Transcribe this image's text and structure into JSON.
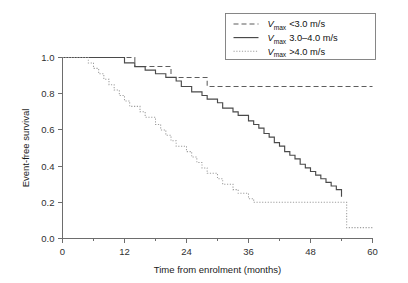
{
  "chart_data": {
    "type": "line",
    "title": "",
    "subtitle": "",
    "xlabel": "Time from enrolment (months)",
    "ylabel": "Event-free survival",
    "xlim": [
      0,
      60
    ],
    "ylim": [
      0.0,
      1.0
    ],
    "xticks": [
      0,
      12,
      24,
      36,
      48,
      60
    ],
    "xtick_labels": [
      "0",
      "12",
      "24",
      "36",
      "48",
      "60"
    ],
    "xminor_ticks": [
      6,
      18,
      30,
      42,
      54
    ],
    "yticks": [
      0.0,
      0.2,
      0.4,
      0.6,
      0.8,
      1.0
    ],
    "ytick_labels": [
      "0.0",
      "0.2",
      "0.4",
      "0.6",
      "0.8",
      "1.0"
    ],
    "grid": false,
    "legend_position": "top-right",
    "step_type": "post",
    "series": [
      {
        "name": "vmax_lt_3",
        "legend_prefix": "V",
        "legend_subscript": "max",
        "legend_value": "<3.0 m/s",
        "linestyle": "dashed",
        "color": "#5d5d5d",
        "x": [
          0,
          13,
          14,
          20,
          21,
          27,
          28,
          30,
          60
        ],
        "y": [
          1.0,
          1.0,
          0.95,
          0.95,
          0.89,
          0.89,
          0.84,
          0.84,
          0.84
        ]
      },
      {
        "name": "vmax_3_to_4",
        "legend_prefix": "V",
        "legend_subscript": "max",
        "legend_value": "3.0–4.0 m/s",
        "linestyle": "solid",
        "color": "#4a4a4a",
        "x": [
          0,
          10,
          12,
          14,
          16,
          18,
          20,
          22,
          23,
          25,
          27,
          28,
          30,
          31,
          33,
          34,
          36,
          37,
          38,
          39,
          40,
          41,
          42,
          43,
          44,
          45,
          46,
          47,
          48,
          49,
          50,
          51,
          52,
          53,
          54
        ],
        "y": [
          1.0,
          1.0,
          0.97,
          0.95,
          0.93,
          0.91,
          0.89,
          0.87,
          0.84,
          0.81,
          0.79,
          0.77,
          0.75,
          0.72,
          0.7,
          0.68,
          0.65,
          0.63,
          0.61,
          0.58,
          0.56,
          0.53,
          0.51,
          0.48,
          0.46,
          0.44,
          0.41,
          0.39,
          0.37,
          0.35,
          0.33,
          0.31,
          0.29,
          0.27,
          0.23
        ]
      },
      {
        "name": "vmax_gt_4",
        "legend_prefix": "V",
        "legend_subscript": "max",
        "legend_value": ">4.0 m/s",
        "linestyle": "dotted",
        "color": "#9e9e9e",
        "x": [
          0,
          4,
          5,
          6,
          7,
          8,
          9,
          10,
          11,
          12,
          13,
          15,
          16,
          18,
          19,
          20,
          21,
          22,
          24,
          25,
          26,
          27,
          28,
          30,
          31,
          33,
          34,
          36,
          37,
          54,
          55,
          60
        ],
        "y": [
          1.0,
          1.0,
          0.97,
          0.94,
          0.91,
          0.88,
          0.85,
          0.82,
          0.79,
          0.76,
          0.73,
          0.7,
          0.67,
          0.63,
          0.6,
          0.57,
          0.54,
          0.51,
          0.48,
          0.45,
          0.42,
          0.39,
          0.36,
          0.33,
          0.3,
          0.27,
          0.25,
          0.22,
          0.2,
          0.2,
          0.06,
          0.06
        ]
      }
    ]
  }
}
